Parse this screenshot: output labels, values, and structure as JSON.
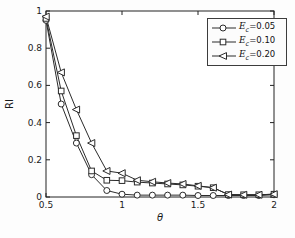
{
  "chart_data": {
    "type": "line",
    "title": "",
    "xlabel": "θ",
    "ylabel": "RI",
    "xlim": [
      0.5,
      2
    ],
    "ylim": [
      0,
      1
    ],
    "x_ticks": [
      "0.5",
      "1",
      "1.5",
      "2"
    ],
    "x_tick_values": [
      0.5,
      1,
      1.5,
      2
    ],
    "y_ticks": [
      "0",
      "0.2",
      "0.4",
      "0.6",
      "0.8",
      "1"
    ],
    "y_tick_values": [
      0,
      0.2,
      0.4,
      0.6,
      0.8,
      1
    ],
    "grid": false,
    "legend_position": "top-right",
    "line_color": "#2b2b2b",
    "marker_fill": "#ffffff",
    "x": [
      0.5,
      0.6,
      0.7,
      0.8,
      0.9,
      1.0,
      1.1,
      1.2,
      1.3,
      1.4,
      1.5,
      1.6,
      1.7,
      1.8,
      1.9,
      2.0
    ],
    "series": [
      {
        "name": "Ec=0.05",
        "marker": "circle",
        "values": [
          0.95,
          0.5,
          0.29,
          0.12,
          0.035,
          0.015,
          0.01,
          0.01,
          0.01,
          0.01,
          0.008,
          0.008,
          0.008,
          0.008,
          0.008,
          0.012
        ],
        "legend": {
          "var": "E",
          "sub": "c",
          "eq": "=0.05"
        }
      },
      {
        "name": "Ec=0.10",
        "marker": "square",
        "values": [
          0.96,
          0.57,
          0.33,
          0.14,
          0.09,
          0.088,
          0.08,
          0.075,
          0.07,
          0.065,
          0.058,
          0.05,
          0.013,
          0.012,
          0.012,
          0.015
        ],
        "legend": {
          "var": "E",
          "sub": "c",
          "eq": "=0.10"
        }
      },
      {
        "name": "Ec=0.20",
        "marker": "triangle-left",
        "values": [
          0.97,
          0.67,
          0.47,
          0.29,
          0.14,
          0.128,
          0.09,
          0.082,
          0.075,
          0.07,
          0.06,
          0.05,
          0.013,
          0.012,
          0.012,
          0.015
        ],
        "legend": {
          "var": "E",
          "sub": "c",
          "eq": "=0.20"
        }
      }
    ]
  }
}
